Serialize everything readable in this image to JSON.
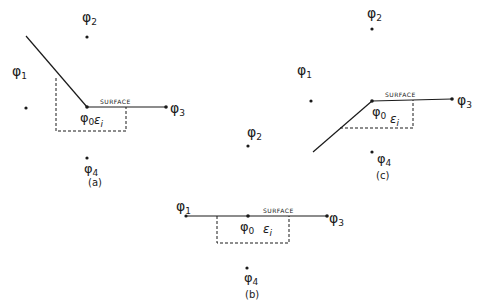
{
  "cropped_header_text": "where the center node and its four nearest neighbors ...",
  "diagrams": [
    {
      "id": "a",
      "caption": "(a)",
      "phi0": "φ0",
      "phi1": "φ1",
      "phi2": "φ2",
      "phi3": "φ3",
      "phi4": "φ4",
      "surface_label": "SURFACE",
      "epsilon_label": "εi"
    },
    {
      "id": "b",
      "caption": "(b)",
      "phi0": "φ0",
      "phi1": "φ1",
      "phi2": "φ2",
      "phi3": "φ3",
      "phi4": "φ4",
      "surface_label": "SURFACE",
      "epsilon_label": "εi"
    },
    {
      "id": "c",
      "caption": "(c)",
      "phi0": "φ0",
      "phi1": "φ1",
      "phi2": "φ2",
      "phi3": "φ3",
      "phi4": "φ4",
      "surface_label": "SURFACE",
      "epsilon_label": "εi"
    }
  ],
  "colors": {
    "ink": "#1a1a1a",
    "background": "#ffffff"
  }
}
